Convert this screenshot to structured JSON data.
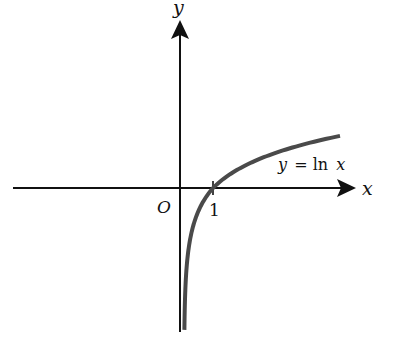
{
  "chart_data": {
    "type": "line",
    "title": "",
    "function": "y = ln x",
    "xlabel": "x",
    "ylabel": "y",
    "origin_label": "O",
    "x_tick_labels": [
      "1"
    ],
    "annotations": [
      {
        "text": "y = ln x",
        "near": [
          3.4,
          1.1
        ]
      }
    ],
    "grid": false,
    "xlim": [
      -5.1,
      5.3
    ],
    "ylim": [
      -4.3,
      5.0
    ],
    "series": [
      {
        "name": "y = ln x",
        "x": [
          0.0136,
          0.05,
          0.1,
          0.2,
          0.3,
          0.5,
          0.7,
          1,
          1.5,
          2,
          2.5,
          3,
          3.5,
          4,
          4.5,
          4.85
        ],
        "y": [
          -4.3,
          -3.0,
          -2.3,
          -1.61,
          -1.2,
          -0.69,
          -0.36,
          0,
          0.41,
          0.69,
          0.92,
          1.1,
          1.25,
          1.39,
          1.5,
          1.58
        ]
      }
    ],
    "colors": {
      "axes": "#111111",
      "curve": "#4a4a4a"
    }
  },
  "labels": {
    "y_axis": "y",
    "x_axis": "x",
    "origin": "O",
    "tick_one": "1",
    "curve_y": "y",
    "curve_eq": "= ln",
    "curve_x": "x"
  }
}
